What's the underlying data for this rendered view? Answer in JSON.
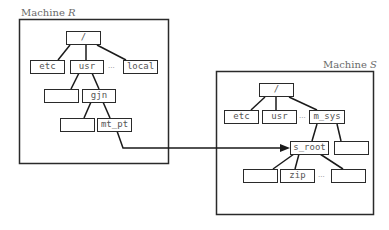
{
  "machines": {
    "r": {
      "label_prefix": "Machine ",
      "label_var": "R",
      "nodes": {
        "root": "/",
        "etc": "etc",
        "usr": "usr",
        "ellipsis": "···",
        "local": "local",
        "blank_a": "",
        "gjn": "gjn",
        "blank_b": "",
        "mt_pt": "mt_pt"
      }
    },
    "s": {
      "label_prefix": "Machine ",
      "label_var": "S",
      "nodes": {
        "root": "/",
        "etc": "etc",
        "usr": "usr",
        "ellipsis": "···",
        "m_sys": "m_sys",
        "s_root": "s_root",
        "blank_right": "",
        "blank_left": "",
        "zip": "zip",
        "ellipsis2": "···",
        "blank_far": ""
      }
    }
  },
  "mount_link": {
    "from": "mt_pt",
    "to": "s_root",
    "color": "#1a1a1a"
  }
}
